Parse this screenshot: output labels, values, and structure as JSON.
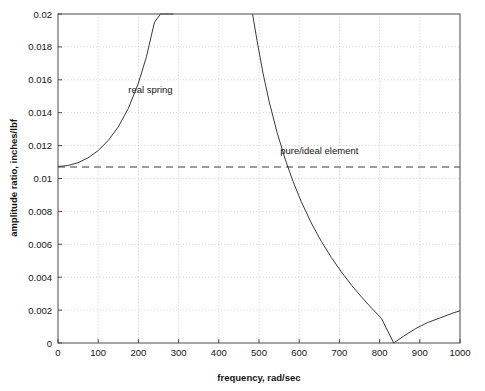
{
  "chart_data": {
    "type": "line",
    "title": "",
    "xlabel": "frequency, rad/sec",
    "ylabel": "amplitude ratio, inches/lbf",
    "xlim": [
      0,
      1000
    ],
    "ylim": [
      0,
      0.02
    ],
    "grid": true,
    "legend_position": "inline-annotations",
    "xticks": [
      0,
      100,
      200,
      300,
      400,
      500,
      600,
      700,
      800,
      900,
      1000
    ],
    "xtick_labels": [
      "0",
      "100",
      "200",
      "300",
      "400",
      "500",
      "600",
      "700",
      "800",
      "900",
      "1000"
    ],
    "yticks": [
      0,
      0.002,
      0.004,
      0.006,
      0.008,
      0.01,
      0.012,
      0.014,
      0.016,
      0.018,
      0.02
    ],
    "ytick_labels": [
      "0",
      "0.002",
      "0.004",
      "0.006",
      "0.008",
      "0.01",
      "0.012",
      "0.014",
      "0.016",
      "0.018",
      "0.02"
    ],
    "annotations": [
      {
        "text": "real spring",
        "x": 230,
        "y": 0.0152
      },
      {
        "text": "pure/ideal element",
        "x": 650,
        "y": 0.0115
      }
    ],
    "series": [
      {
        "name": "real spring",
        "style": "solid",
        "color": "#3a3a3a",
        "branches": [
          {
            "name": "below-resonance",
            "x": [
              0,
              25,
              50,
              75,
              100,
              125,
              150,
              175,
              200,
              220,
              240,
              255,
              265,
              275,
              282,
              287
            ],
            "y": [
              0.01073,
              0.01079,
              0.01096,
              0.01126,
              0.0117,
              0.01231,
              0.01314,
              0.01426,
              0.0158,
              0.0174,
              0.0195,
              0.02,
              0.02,
              0.02,
              0.02,
              0.02
            ]
          },
          {
            "name": "above-resonance",
            "x": [
              484,
              495,
              510,
              525,
              545,
              565,
              585,
              605,
              630,
              655,
              680,
              705,
              730,
              755,
              780,
              805,
              835,
              860,
              890,
              920,
              950,
              980,
              1000
            ],
            "y": [
              0.02,
              0.0184,
              0.0164,
              0.0147,
              0.0128,
              0.01118,
              0.0098,
              0.0086,
              0.0073,
              0.00618,
              0.0052,
              0.00432,
              0.00352,
              0.0028,
              0.00212,
              0.00148,
              0.0,
              0.00042,
              0.00088,
              0.00125,
              0.00152,
              0.0018,
              0.00196
            ]
          }
        ]
      },
      {
        "name": "pure/ideal element",
        "style": "dashed",
        "color": "#3a3a3a",
        "constant_value": 0.0107,
        "x": [
          0,
          1000
        ],
        "y": [
          0.0107,
          0.0107
        ]
      }
    ],
    "notes": {
      "resonance_low_asymptote_rad_per_sec": 290,
      "resonance_high_asymptote_rad_per_sec": 480,
      "antiresonance_null_rad_per_sec": 835
    }
  }
}
